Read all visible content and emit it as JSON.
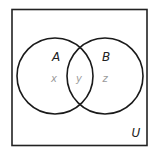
{
  "diagram": {
    "type": "venn",
    "universe_label": "U",
    "sets": [
      {
        "name": "A",
        "region_label": "x"
      },
      {
        "name": "B",
        "region_label": "z"
      }
    ],
    "intersection_label": "y",
    "colors": {
      "stroke": "#1a1a1a",
      "set_label": "#222222",
      "region_label": "#9a9a9a"
    }
  }
}
